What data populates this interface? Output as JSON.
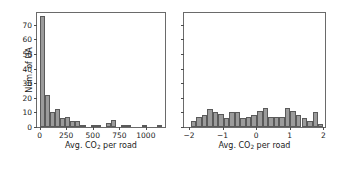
{
  "figure": {
    "width": 341,
    "height": 172,
    "background": "#ffffff",
    "bar_fill": "#9b9b9b",
    "bar_edge": "#5a5a5a",
    "axis_color": "#6a6a6a"
  },
  "chart_data": [
    {
      "type": "bar",
      "id": "left-histogram",
      "title": "",
      "xlabel_parts": {
        "pre": "Avg. CO",
        "sub": "2",
        "post": " per road"
      },
      "xlabel": "Avg. CO2 per road",
      "ylabel": "Num. of UA",
      "xlim": [
        -25,
        1180
      ],
      "ylim": [
        0,
        78
      ],
      "grid": false,
      "legend": null,
      "xticks": [
        0,
        250,
        500,
        750,
        1000
      ],
      "xticklabels": [
        "0",
        "250",
        "500",
        "750",
        "1000"
      ],
      "yticks": [
        0,
        10,
        20,
        30,
        40,
        50,
        60,
        70
      ],
      "yticklabels": [
        "0",
        "10",
        "20",
        "30",
        "40",
        "50",
        "60",
        "70"
      ],
      "bin_edges": [
        0,
        48,
        96,
        144,
        192,
        240,
        288,
        336,
        384,
        432,
        480,
        528,
        576,
        624,
        672,
        720,
        768,
        816,
        864,
        912,
        960,
        1008,
        1056,
        1104,
        1152
      ],
      "values": [
        76,
        22,
        10,
        12,
        6,
        7,
        4,
        4,
        1,
        0,
        1,
        1,
        0,
        3,
        5,
        0,
        1,
        1,
        0,
        0,
        1,
        0,
        0,
        1
      ],
      "categories": [
        "0-48",
        "48-96",
        "96-144",
        "144-192",
        "192-240",
        "240-288",
        "288-336",
        "336-384",
        "384-432",
        "432-480",
        "480-528",
        "528-576",
        "576-624",
        "624-672",
        "672-720",
        "720-768",
        "768-816",
        "816-864",
        "864-912",
        "912-960",
        "960-1008",
        "1008-1056",
        "1056-1104",
        "1104-1152"
      ]
    },
    {
      "type": "bar",
      "id": "right-histogram",
      "title": "",
      "xlabel_parts": {
        "pre": "Avg. CO",
        "sub": "2",
        "post": " per road"
      },
      "xlabel": "Avg. CO2 per road",
      "ylabel": "",
      "xlim": [
        -2.15,
        2.05
      ],
      "ylim": [
        0,
        78
      ],
      "grid": false,
      "legend": null,
      "xticks": [
        -2,
        -1,
        0,
        1,
        2
      ],
      "xticklabels": [
        "−2",
        "−1",
        "0",
        "1",
        "2"
      ],
      "yticks": [
        0,
        10,
        20,
        30,
        40,
        50,
        60,
        70
      ],
      "yticklabels": [
        "",
        "",
        "",
        "",
        "",
        "",
        "",
        ""
      ],
      "bin_edges": [
        -1.95,
        -1.79,
        -1.62,
        -1.46,
        -1.29,
        -1.13,
        -0.96,
        -0.8,
        -0.63,
        -0.47,
        -0.3,
        -0.14,
        0.03,
        0.19,
        0.36,
        0.52,
        0.69,
        0.85,
        1.02,
        1.18,
        1.35,
        1.51,
        1.68,
        1.84,
        2.0
      ],
      "values": [
        4,
        7,
        8,
        12,
        10,
        9,
        6,
        10,
        10,
        6,
        7,
        8,
        11,
        13,
        7,
        7,
        7,
        13,
        11,
        8,
        6,
        4,
        10,
        2
      ],
      "categories": [
        "b1",
        "b2",
        "b3",
        "b4",
        "b5",
        "b6",
        "b7",
        "b8",
        "b9",
        "b10",
        "b11",
        "b12",
        "b13",
        "b14",
        "b15",
        "b16",
        "b17",
        "b18",
        "b19",
        "b20",
        "b21",
        "b22",
        "b23",
        "b24"
      ]
    }
  ]
}
